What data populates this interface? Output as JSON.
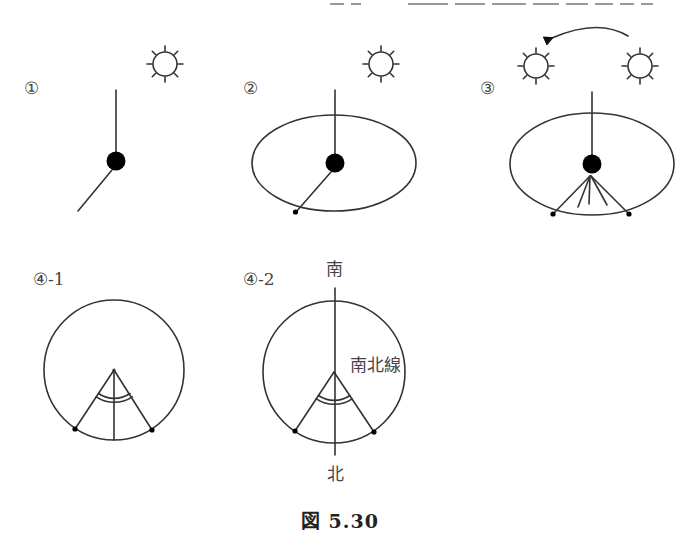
{
  "figure": {
    "caption": "図 5.30",
    "top_text_cutoff": true
  },
  "panels": [
    {
      "id": "1",
      "label": "①",
      "description": "Stick with vertical pole, gnomon ball, and shadow line; sun upper right"
    },
    {
      "id": "2",
      "label": "②",
      "description": "Stick with shadow tip marked on ellipse (circle drawn on ground)"
    },
    {
      "id": "3",
      "label": "③",
      "description": "Sun moves across sky (arrow); multiple shadow lines, two marks on ellipse"
    },
    {
      "id": "4-1",
      "label": "④-1",
      "description": "Circle with two marks; angle bisected by line from center"
    },
    {
      "id": "4-2",
      "label": "④-2",
      "description": "Bisector extended as north-south line"
    }
  ],
  "annotations": {
    "south": "南",
    "north": "北",
    "ns_line": "南北線"
  },
  "colors": {
    "stroke": "#333333",
    "fill_dot": "#000000",
    "background": "#ffffff"
  }
}
